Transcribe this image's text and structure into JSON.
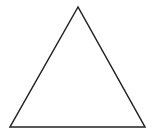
{
  "diagram": {
    "background": "#ffffff",
    "shapes": [
      {
        "type": "triangle",
        "kind": "equilateral",
        "fill": "none",
        "stroke": "#222222",
        "stroke_width": 1.5,
        "points": [
          [
            78,
            7
          ],
          [
            10,
            127
          ],
          [
            145,
            127
          ]
        ]
      }
    ]
  }
}
